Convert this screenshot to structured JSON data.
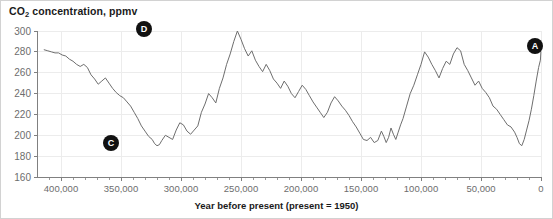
{
  "figure": {
    "title": "CO",
    "title_sub": "2",
    "title_rest": " concentration, ppmv",
    "title_full": "CO2 concentration, ppmv",
    "xlabel": "Year before present (present = 1950)",
    "background": "#ffffff",
    "line_color": "#6e6e6e",
    "grid_color": "#ececec",
    "marker_color": "#111111"
  },
  "chart_data": {
    "type": "line",
    "title": "CO2 concentration, ppmv",
    "xlabel": "Year before present (present = 1950)",
    "ylabel": "CO2 concentration, ppmv",
    "xlim": [
      420000,
      0
    ],
    "ylim": [
      160,
      300
    ],
    "x_tick_labels": [
      "400,000",
      "350,000",
      "300,000",
      "250,000",
      "200,000",
      "150,000",
      "100,000",
      "50,000",
      "0"
    ],
    "x_ticks": [
      400000,
      350000,
      300000,
      250000,
      200000,
      150000,
      100000,
      50000,
      0
    ],
    "x_minor_tick_interval": 10000,
    "y_ticks": [
      160,
      180,
      200,
      220,
      240,
      260,
      280,
      300
    ],
    "y_tick_labels": [
      "160",
      "180",
      "200",
      "220",
      "240",
      "260",
      "280",
      "300"
    ],
    "grid": true,
    "legend": null,
    "x_axis_direction": "reversed",
    "series": [
      {
        "name": "CO2 concentration (Vostok ice core)",
        "x": [
          414000,
          411000,
          408000,
          405000,
          402000,
          399000,
          396000,
          393000,
          390000,
          387000,
          384000,
          381000,
          378000,
          375000,
          372000,
          369000,
          366000,
          363000,
          360000,
          357000,
          354000,
          351000,
          348000,
          345000,
          342000,
          339000,
          336000,
          333000,
          330000,
          327000,
          324000,
          322000,
          320000,
          318000,
          316000,
          313000,
          310000,
          307000,
          304000,
          301000,
          298000,
          295000,
          292000,
          289000,
          286000,
          283000,
          280000,
          277000,
          274000,
          271000,
          268000,
          265000,
          262000,
          259000,
          256000,
          253000,
          250000,
          247000,
          244000,
          241000,
          238000,
          235000,
          232000,
          229000,
          226000,
          223000,
          220000,
          217000,
          214000,
          211000,
          208000,
          205000,
          202000,
          199000,
          196000,
          193000,
          190000,
          187000,
          184000,
          181000,
          178000,
          175000,
          172000,
          169000,
          166000,
          163000,
          160000,
          157000,
          154000,
          151000,
          148000,
          145000,
          142000,
          139000,
          136000,
          133000,
          131000,
          129000,
          127000,
          125000,
          123000,
          121000,
          119000,
          117000,
          115000,
          112000,
          109000,
          106000,
          103000,
          100000,
          97000,
          94000,
          91000,
          88000,
          85000,
          82000,
          79000,
          76000,
          73000,
          70000,
          67000,
          64000,
          61000,
          58000,
          55000,
          52000,
          49000,
          46000,
          43000,
          40000,
          37000,
          34000,
          31000,
          28000,
          25000,
          22000,
          20000,
          18000,
          16000,
          14000,
          12000,
          10000,
          8000,
          6000,
          4000,
          2000,
          500,
          100
        ],
        "y": [
          282,
          281,
          280,
          279,
          279,
          277,
          276,
          273,
          271,
          268,
          266,
          268,
          265,
          258,
          254,
          249,
          252,
          255,
          250,
          245,
          241,
          238,
          236,
          232,
          228,
          222,
          216,
          209,
          204,
          199,
          196,
          192,
          190,
          191,
          195,
          200,
          198,
          196,
          205,
          212,
          210,
          204,
          201,
          205,
          209,
          222,
          230,
          240,
          236,
          231,
          245,
          255,
          268,
          278,
          290,
          300,
          292,
          283,
          276,
          281,
          272,
          266,
          261,
          268,
          262,
          254,
          250,
          245,
          252,
          247,
          240,
          236,
          242,
          248,
          244,
          238,
          232,
          227,
          222,
          217,
          222,
          231,
          237,
          233,
          228,
          224,
          219,
          213,
          208,
          202,
          196,
          195,
          198,
          193,
          195,
          204,
          199,
          193,
          198,
          207,
          201,
          196,
          203,
          210,
          216,
          228,
          240,
          248,
          258,
          268,
          280,
          275,
          268,
          262,
          255,
          264,
          271,
          268,
          278,
          284,
          281,
          268,
          262,
          255,
          248,
          252,
          245,
          241,
          236,
          228,
          225,
          220,
          215,
          210,
          208,
          203,
          198,
          192,
          190,
          196,
          205,
          214,
          225,
          238,
          252,
          265,
          272,
          280
        ],
        "color": "#6e6e6e"
      }
    ],
    "annotations": [
      {
        "label": "A",
        "x": 1000,
        "y": 284,
        "description": "present-day / recent rise marker",
        "pixel_x": 534,
        "pixel_y": 45
      },
      {
        "label": "C",
        "x": 340000,
        "y": 188,
        "description": "glacial minimum marker",
        "pixel_x": 110,
        "pixel_y": 142
      },
      {
        "label": "D",
        "x": 323000,
        "y": 302,
        "description": "interglacial maximum marker",
        "pixel_x": 143,
        "pixel_y": 28
      }
    ]
  }
}
